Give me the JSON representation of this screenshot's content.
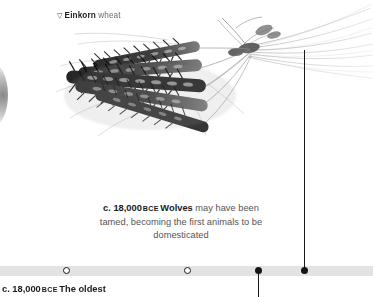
{
  "specimen": {
    "marker_icon": "triangle-down-icon",
    "name": "Einkorn",
    "suffix": "wheat"
  },
  "illustration": {
    "name": "einkorn-wheat-sheaf",
    "description": "grayscale photographic sheaf of einkorn wheat ears with long awns"
  },
  "caption": {
    "date": "c. 18,000",
    "era": "BCE",
    "subject": "Wolves",
    "line1_tail": "may",
    "line2": "have been tamed, becoming",
    "line3": "the first animals to",
    "line4": "be domesticated"
  },
  "bottom_entry": {
    "date": "c. 18,000",
    "era": "BCE",
    "subject": "The oldest"
  },
  "timeline": {
    "bar_color": "#e3e3e3",
    "marker_color": "#141414",
    "markers": [
      {
        "id": "node-hollow-1",
        "x": 63,
        "type": "hollow"
      },
      {
        "id": "node-hollow-2",
        "x": 184,
        "type": "hollow"
      },
      {
        "id": "node-solid-1",
        "x": 255,
        "type": "solid",
        "leader": "down"
      },
      {
        "id": "node-solid-2",
        "x": 301,
        "type": "solid",
        "leader": "up"
      }
    ]
  }
}
